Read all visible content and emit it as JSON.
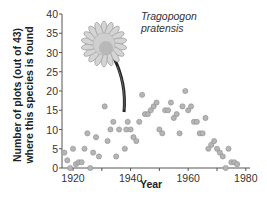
{
  "chart_data": {
    "type": "scatter",
    "title": "",
    "annotation": "Tragopogon pratensis",
    "xlabel": "Year",
    "ylabel": "Number of plots (out of 43) where this species is found",
    "xlim": [
      1916,
      1982
    ],
    "ylim": [
      0,
      40
    ],
    "x_ticks": [
      1920,
      1940,
      1960,
      1980
    ],
    "y_ticks": [
      0,
      5,
      10,
      15,
      20,
      25,
      30,
      35,
      40
    ],
    "grid": false,
    "legend": null,
    "series": [
      {
        "name": "Tragopogon pratensis",
        "points": [
          [
            1917,
            4
          ],
          [
            1918,
            2
          ],
          [
            1919,
            0
          ],
          [
            1920,
            5
          ],
          [
            1921,
            1
          ],
          [
            1922,
            1.5
          ],
          [
            1923,
            1.5
          ],
          [
            1924,
            5
          ],
          [
            1925,
            9
          ],
          [
            1926,
            0
          ],
          [
            1927,
            4
          ],
          [
            1928,
            8
          ],
          [
            1929,
            3
          ],
          [
            1931,
            16
          ],
          [
            1932,
            7
          ],
          [
            1933,
            10
          ],
          [
            1934,
            12
          ],
          [
            1935,
            3
          ],
          [
            1936,
            10
          ],
          [
            1938,
            5
          ],
          [
            1938.5,
            10
          ],
          [
            1939,
            12
          ],
          [
            1940,
            10
          ],
          [
            1941,
            8
          ],
          [
            1942,
            7
          ],
          [
            1943,
            12
          ],
          [
            1944,
            19
          ],
          [
            1945,
            14
          ],
          [
            1946,
            14
          ],
          [
            1947,
            15
          ],
          [
            1948,
            16
          ],
          [
            1949,
            17
          ],
          [
            1950,
            10
          ],
          [
            1951,
            9
          ],
          [
            1952,
            15
          ],
          [
            1953,
            15
          ],
          [
            1954,
            17
          ],
          [
            1955,
            13
          ],
          [
            1956,
            14
          ],
          [
            1957,
            9
          ],
          [
            1958,
            16
          ],
          [
            1959,
            20
          ],
          [
            1960,
            15
          ],
          [
            1961,
            16
          ],
          [
            1962,
            12
          ],
          [
            1963,
            12
          ],
          [
            1964,
            9
          ],
          [
            1965,
            9
          ],
          [
            1966,
            13
          ],
          [
            1967,
            5
          ],
          [
            1968,
            6
          ],
          [
            1969,
            7
          ],
          [
            1970,
            5
          ],
          [
            1971,
            4
          ],
          [
            1972,
            3
          ],
          [
            1973,
            0
          ],
          [
            1974,
            5
          ],
          [
            1975,
            1.5
          ],
          [
            1976,
            1.5
          ],
          [
            1977,
            1
          ]
        ]
      }
    ]
  }
}
